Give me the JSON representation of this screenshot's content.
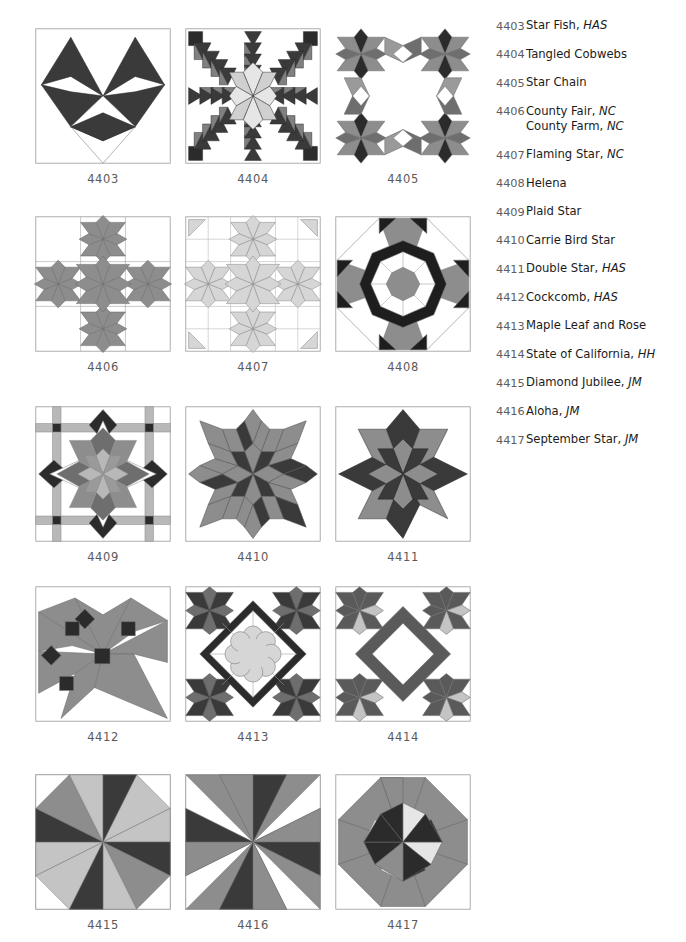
{
  "page": {
    "palette": {
      "dark": "#3a3a3a",
      "darker": "#2b2b2b",
      "mid": "#808080",
      "mid_light": "#9a9a9a",
      "light": "#d0d0d0",
      "lighter": "#e6e6e6",
      "white": "#ffffff",
      "outline": "#9e9e9e",
      "caption": "#5a5a5a"
    }
  },
  "blocks": [
    {
      "id": "4403",
      "caption": "4403",
      "name": "Star Fish",
      "pattern": "star-fish"
    },
    {
      "id": "4404",
      "caption": "4404",
      "name": "Tangled Cobwebs",
      "pattern": "tangled-cobwebs"
    },
    {
      "id": "4405",
      "caption": "4405",
      "name": "Star Chain",
      "pattern": "star-chain"
    },
    {
      "id": "4406",
      "caption": "4406",
      "name": "County Fair",
      "pattern": "county-fair"
    },
    {
      "id": "4407",
      "caption": "4407",
      "name": "Flaming Star",
      "pattern": "flaming-star"
    },
    {
      "id": "4408",
      "caption": "4408",
      "name": "Helena",
      "pattern": "helena"
    },
    {
      "id": "4409",
      "caption": "4409",
      "name": "Plaid Star",
      "pattern": "plaid-star"
    },
    {
      "id": "4410",
      "caption": "4410",
      "name": "Carrie Bird Star",
      "pattern": "carrie-bird-star"
    },
    {
      "id": "4411",
      "caption": "4411",
      "name": "Double Star",
      "pattern": "double-star"
    },
    {
      "id": "4412",
      "caption": "4412",
      "name": "Cockcomb",
      "pattern": "cockcomb"
    },
    {
      "id": "4413",
      "caption": "4413",
      "name": "Maple Leaf and Rose",
      "pattern": "maple-leaf-and-rose"
    },
    {
      "id": "4414",
      "caption": "4414",
      "name": "State of California",
      "pattern": "state-of-california"
    },
    {
      "id": "4415",
      "caption": "4415",
      "name": "Diamond Jubilee",
      "pattern": "diamond-jubilee"
    },
    {
      "id": "4416",
      "caption": "4416",
      "name": "Aloha",
      "pattern": "aloha"
    },
    {
      "id": "4417",
      "caption": "4417",
      "name": "September Star",
      "pattern": "september-star"
    }
  ],
  "legend": {
    "entries": [
      {
        "number": "4403",
        "names": [
          {
            "title": "Star Fish,",
            "source": "HAS"
          }
        ]
      },
      {
        "number": "4404",
        "names": [
          {
            "title": "Tangled Cobwebs",
            "source": ""
          }
        ]
      },
      {
        "number": "4405",
        "names": [
          {
            "title": "Star Chain",
            "source": ""
          }
        ]
      },
      {
        "number": "4406",
        "names": [
          {
            "title": "County Fair,",
            "source": "NC"
          },
          {
            "title": "County Farm,",
            "source": "NC"
          }
        ]
      },
      {
        "number": "4407",
        "names": [
          {
            "title": "Flaming Star,",
            "source": "NC"
          }
        ]
      },
      {
        "number": "4408",
        "names": [
          {
            "title": "Helena",
            "source": ""
          }
        ]
      },
      {
        "number": "4409",
        "names": [
          {
            "title": "Plaid Star",
            "source": ""
          }
        ]
      },
      {
        "number": "4410",
        "names": [
          {
            "title": "Carrie Bird Star",
            "source": ""
          }
        ]
      },
      {
        "number": "4411",
        "names": [
          {
            "title": "Double Star,",
            "source": "HAS"
          }
        ]
      },
      {
        "number": "4412",
        "names": [
          {
            "title": "Cockcomb,",
            "source": "HAS"
          }
        ]
      },
      {
        "number": "4413",
        "names": [
          {
            "title": "Maple Leaf and Rose",
            "source": ""
          }
        ]
      },
      {
        "number": "4414",
        "names": [
          {
            "title": "State of California,",
            "source": "HH"
          }
        ]
      },
      {
        "number": "4415",
        "names": [
          {
            "title": "Diamond Jubilee,",
            "source": "JM"
          }
        ]
      },
      {
        "number": "4416",
        "names": [
          {
            "title": "Aloha,",
            "source": "JM"
          }
        ]
      },
      {
        "number": "4417",
        "names": [
          {
            "title": "September Star,",
            "source": "JM"
          }
        ]
      }
    ]
  }
}
